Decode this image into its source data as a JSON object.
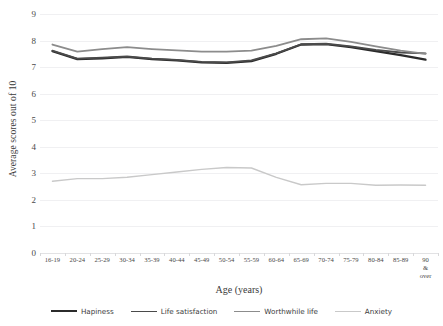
{
  "chart_data": {
    "type": "line",
    "title": "",
    "xlabel": "Age (years)",
    "ylabel": "Average scores out of 10",
    "ylim": [
      0,
      9
    ],
    "yticks": [
      0,
      1,
      2,
      3,
      4,
      5,
      6,
      7,
      8,
      9
    ],
    "grid": true,
    "legend_position": "bottom",
    "categories": [
      "16-19",
      "20-24",
      "25-29",
      "30-34",
      "35-39",
      "40-44",
      "45-49",
      "50-54",
      "55-59",
      "60-64",
      "65-69",
      "70-74",
      "75-79",
      "80-84",
      "85-89",
      "90 &\nover"
    ],
    "series": [
      {
        "name": "Hapiness",
        "color": "#2b2b2b",
        "width": 2.2,
        "values": [
          7.6,
          7.3,
          7.33,
          7.38,
          7.3,
          7.25,
          7.18,
          7.16,
          7.22,
          7.5,
          7.85,
          7.86,
          7.75,
          7.6,
          7.45,
          7.28
        ]
      },
      {
        "name": "Life satisfaction",
        "color": "#4a4a4a",
        "width": 1.8,
        "values": [
          7.62,
          7.32,
          7.36,
          7.4,
          7.32,
          7.27,
          7.2,
          7.18,
          7.25,
          7.52,
          7.86,
          7.88,
          7.78,
          7.65,
          7.55,
          7.52
        ]
      },
      {
        "name": "Worthwhile life",
        "color": "#8c8c8c",
        "width": 1.8,
        "values": [
          7.85,
          7.58,
          7.68,
          7.75,
          7.68,
          7.63,
          7.58,
          7.58,
          7.62,
          7.8,
          8.05,
          8.08,
          7.95,
          7.78,
          7.62,
          7.5
        ]
      },
      {
        "name": "Anxiety",
        "color": "#c9c9c9",
        "width": 1.4,
        "values": [
          2.7,
          2.8,
          2.8,
          2.85,
          2.95,
          3.05,
          3.15,
          3.22,
          3.2,
          2.85,
          2.57,
          2.62,
          2.62,
          2.55,
          2.56,
          2.55
        ]
      }
    ]
  },
  "axes": {
    "y_title": "Average scores out of 10",
    "x_title": "Age (years)"
  }
}
